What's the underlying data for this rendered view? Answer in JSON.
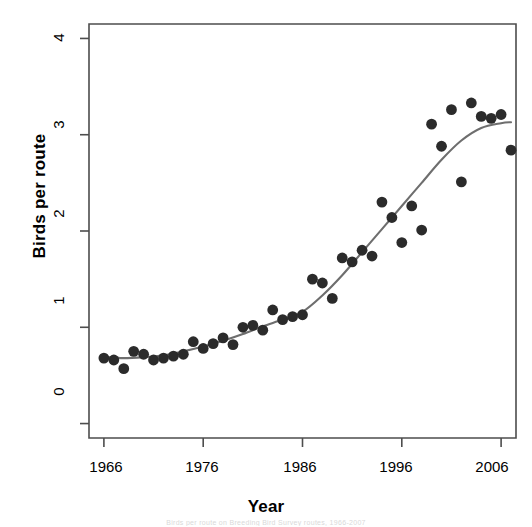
{
  "chart_data": {
    "type": "scatter",
    "title": "",
    "xlabel": "Year",
    "ylabel": "Birds per route",
    "xlim": [
      1964.5,
      2007.5
    ],
    "ylim": [
      -0.15,
      4.15
    ],
    "xticks": [
      1966,
      1976,
      1986,
      1996,
      2006
    ],
    "yticks": [
      0,
      1,
      2,
      3,
      4
    ],
    "xtick_labels": [
      "1966",
      "1976",
      "1986",
      "1996",
      "2006"
    ],
    "ytick_labels": [
      "0",
      "1",
      "2",
      "3",
      "4"
    ],
    "grid": false,
    "legend": "none",
    "point_color": "#2b2b2b",
    "line_color": "#6e6e6e",
    "axis_color": "#4d4d4d",
    "background": "#ffffff",
    "series": [
      {
        "name": "Birds per route",
        "marker": "filled-circle",
        "x": [
          1966,
          1967,
          1968,
          1969,
          1970,
          1971,
          1972,
          1973,
          1974,
          1975,
          1976,
          1977,
          1978,
          1979,
          1980,
          1981,
          1982,
          1983,
          1984,
          1985,
          1986,
          1987,
          1988,
          1989,
          1990,
          1991,
          1992,
          1993,
          1994,
          1995,
          1996,
          1997,
          1998,
          1999,
          2000,
          2001,
          2002,
          2003,
          2004,
          2005,
          2006,
          2007
        ],
        "y": [
          0.68,
          0.66,
          0.57,
          0.75,
          0.72,
          0.66,
          0.68,
          0.7,
          0.72,
          0.85,
          0.78,
          0.83,
          0.89,
          0.82,
          1.0,
          1.02,
          0.97,
          1.18,
          1.08,
          1.11,
          1.13,
          1.5,
          1.46,
          1.3,
          1.72,
          1.68,
          1.8,
          1.74,
          2.3,
          2.14,
          1.88,
          2.26,
          2.01,
          3.11,
          2.88,
          3.26,
          2.51,
          3.33,
          3.19,
          3.17,
          3.21,
          2.84
        ],
        "trend": {
          "name": "loess-smooth",
          "x": [
            1966,
            1968,
            1970,
            1972,
            1974,
            1976,
            1978,
            1980,
            1982,
            1984,
            1986,
            1988,
            1990,
            1992,
            1994,
            1996,
            1998,
            2000,
            2002,
            2004,
            2006,
            2007
          ],
          "y": [
            0.69,
            0.68,
            0.69,
            0.71,
            0.75,
            0.8,
            0.86,
            0.93,
            1.01,
            1.08,
            1.16,
            1.33,
            1.54,
            1.78,
            2.02,
            2.26,
            2.5,
            2.74,
            2.94,
            3.07,
            3.12,
            3.13
          ]
        }
      }
    ]
  },
  "axes": {
    "x_title": "Year",
    "y_title": "Birds per route"
  },
  "footnote": "Birds per route on Breeding Bird Survey routes, 1966-2007"
}
